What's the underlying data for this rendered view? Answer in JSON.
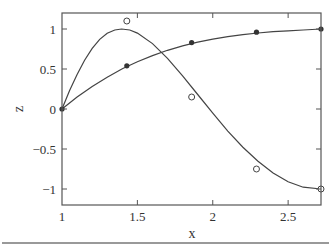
{
  "chart_data": {
    "type": "line",
    "title": "",
    "xlabel": "x",
    "ylabel": "z",
    "xlim": [
      1,
      2.718
    ],
    "ylim": [
      -1.2,
      1.2
    ],
    "grid": false,
    "legend": null,
    "x_ticks": [
      1,
      1.5,
      2,
      2.5
    ],
    "x_tick_labels": [
      "1",
      "1.5",
      "2",
      "2.5"
    ],
    "y_ticks": [
      1,
      0.5,
      0,
      -0.5,
      -1
    ],
    "y_tick_labels": [
      "1",
      "0.5",
      "0",
      "−0.5",
      "−1"
    ],
    "series": [
      {
        "name": "sin(pi/2 * ln x) curve",
        "style": "line",
        "x": [
          1.0,
          1.1,
          1.2,
          1.3,
          1.4,
          1.5,
          1.6,
          1.7,
          1.8,
          1.9,
          2.0,
          2.1,
          2.2,
          2.3,
          2.4,
          2.5,
          2.6,
          2.718
        ],
        "values": [
          0.0,
          0.149,
          0.282,
          0.398,
          0.502,
          0.591,
          0.668,
          0.734,
          0.789,
          0.835,
          0.873,
          0.904,
          0.93,
          0.95,
          0.966,
          0.978,
          0.987,
          1.0
        ]
      },
      {
        "name": "filled samples",
        "style": "marker-filled",
        "x": [
          1.0,
          1.43,
          1.86,
          2.29,
          2.718
        ],
        "values": [
          0.0,
          0.54,
          0.83,
          0.96,
          1.0
        ]
      },
      {
        "name": "sin(3pi/2 * ln x) curve",
        "style": "line",
        "x": [
          1.0,
          1.05,
          1.1,
          1.15,
          1.2,
          1.25,
          1.3,
          1.35,
          1.3956,
          1.45,
          1.5,
          1.6,
          1.7,
          1.8,
          1.9,
          2.0,
          2.1,
          2.2,
          2.3,
          2.4,
          2.5,
          2.6,
          2.718
        ],
        "values": [
          0.0,
          0.227,
          0.433,
          0.609,
          0.758,
          0.87,
          0.946,
          0.988,
          1.0,
          0.987,
          0.949,
          0.818,
          0.633,
          0.414,
          0.181,
          -0.053,
          -0.276,
          -0.477,
          -0.653,
          -0.799,
          -0.909,
          -0.977,
          -1.0
        ]
      },
      {
        "name": "open-circle samples",
        "style": "marker-open",
        "x": [
          1.43,
          1.86,
          2.29,
          2.718
        ],
        "values": [
          1.1,
          0.15,
          -0.75,
          -1.0
        ]
      }
    ]
  }
}
